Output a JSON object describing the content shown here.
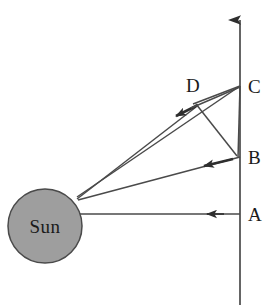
{
  "figure": {
    "type": "geometric-diagram",
    "background_color": "#ffffff",
    "line_color": "#3a3a3a",
    "label_color": "#1a1a1a"
  },
  "sun": {
    "label": "Sun",
    "fill_color": "#9e9e9e",
    "stroke_color": "#4a4a4a",
    "center_x": 45,
    "center_y": 226,
    "radius": 37
  },
  "axis": {
    "name": "vertical-axis",
    "x": 240,
    "top_y": 14,
    "bottom_y": 305,
    "has_arrow_head": true,
    "arrow_direction": "up"
  },
  "points": [
    {
      "id": "A",
      "label": "A",
      "x": 240,
      "y": 214,
      "label_x": 248,
      "label_y": 221
    },
    {
      "id": "B",
      "label": "B",
      "x": 240,
      "y": 157,
      "label_x": 248,
      "label_y": 164
    },
    {
      "id": "C",
      "label": "C",
      "x": 240,
      "y": 86,
      "label_x": 248,
      "label_y": 93
    },
    {
      "id": "D",
      "label": "D",
      "x": 190,
      "y": 104,
      "label_x": 190,
      "label_y": 92
    }
  ],
  "rays": [
    {
      "name": "sun-to-a-ray",
      "from": "sun-edge",
      "to": "A",
      "arrow_at": "toward-sun",
      "arrow_x": 212,
      "arrow_y": 214
    },
    {
      "name": "sun-to-b-ray",
      "from": "sun-edge",
      "to": "B",
      "arrow_at": "toward-sun",
      "arrow_x": 201,
      "arrow_y": 167
    },
    {
      "name": "sun-to-c-ray",
      "from": "sun-edge",
      "to": "C",
      "arrow_at": "none"
    },
    {
      "name": "sun-to-d-ray",
      "from": "sun-edge",
      "to": "D",
      "arrow_at": "toward-sun",
      "arrow_x": 172,
      "arrow_y": 118
    },
    {
      "name": "c-to-b-segment",
      "from": "C",
      "to": "B",
      "arrow_at": "none"
    },
    {
      "name": "c-to-d-segment",
      "from": "C",
      "to": "D",
      "arrow_at": "none"
    }
  ]
}
